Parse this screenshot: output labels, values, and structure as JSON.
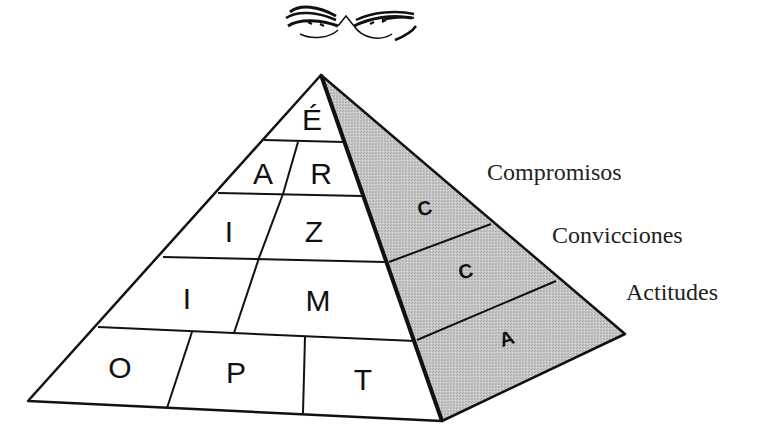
{
  "diagram": {
    "type": "pyramid",
    "ornament": "flourish-ornament",
    "colors": {
      "line": "#111111",
      "front_fill": "#ffffff",
      "side_fill": "#c8c8c8"
    },
    "front_face": {
      "rows": [
        {
          "cells": [
            "É"
          ]
        },
        {
          "cells": [
            "A",
            "R"
          ]
        },
        {
          "cells": [
            "I",
            "Z"
          ]
        },
        {
          "cells": [
            "I",
            "M"
          ]
        },
        {
          "cells": [
            "O",
            "P",
            "T"
          ]
        }
      ]
    },
    "side_face": {
      "bands": [
        {
          "letter": "C",
          "label": "Compromisos"
        },
        {
          "letter": "C",
          "label": "Convicciones"
        },
        {
          "letter": "A",
          "label": "Actitudes"
        }
      ]
    }
  }
}
